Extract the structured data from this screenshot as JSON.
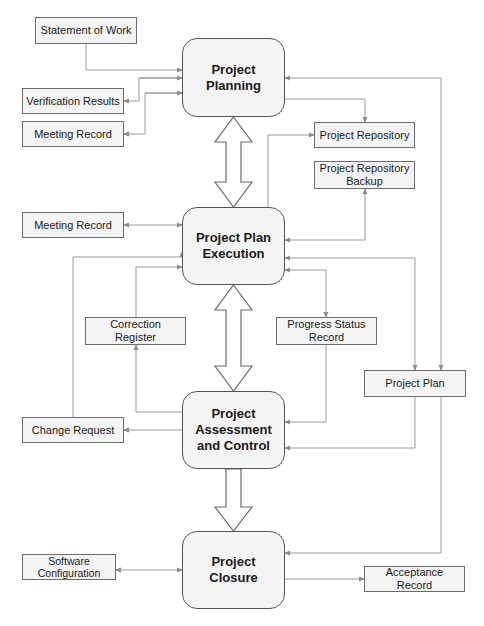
{
  "diagram": {
    "phases": {
      "planning": "Project\nPlanning",
      "execution": "Project Plan\nExecution",
      "assessment": "Project\nAssessment\nand Control",
      "closure": "Project Closure"
    },
    "artifacts": {
      "statement_of_work": "Statement of Work",
      "verification_results": "Verification Results",
      "meeting_record_top": "Meeting Record",
      "project_repository": "Project Repository",
      "project_repository_backup": "Project Repository\nBackup",
      "meeting_record_mid": "Meeting Record",
      "correction_register": "Correction Register",
      "progress_status_record": "Progress Status\nRecord",
      "project_plan": "Project Plan",
      "change_request": "Change Request",
      "software_configuration": "Software\nConfiguration",
      "acceptance_record": "Acceptance Record"
    },
    "colors": {
      "line": "#8c8c8c",
      "box_fill": "#f4f4f4",
      "box_border": "#6b6b6b",
      "text": "#1a1a1a"
    }
  }
}
